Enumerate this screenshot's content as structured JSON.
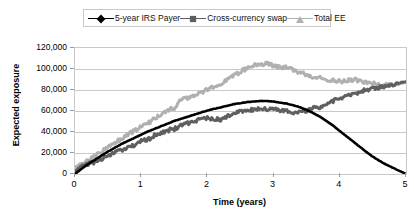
{
  "chart_data": {
    "type": "line",
    "title": "",
    "xlabel": "Time (years)",
    "ylabel": "Expected exposure",
    "xlim": [
      0,
      5
    ],
    "ylim": [
      0,
      120000
    ],
    "xticks": [
      "0",
      "1",
      "2",
      "3",
      "4",
      "5"
    ],
    "yticks": [
      "0",
      "20,000",
      "40,000",
      "60,000",
      "80,000",
      "100,000",
      "120,000"
    ],
    "grid": true,
    "legend_position": "top",
    "series": [
      {
        "name": "5-year IRS Payer",
        "color": "#000000",
        "marker": "diamond",
        "x": [
          0,
          0.1,
          0.2,
          0.3,
          0.4,
          0.5,
          0.6,
          0.7,
          0.8,
          0.9,
          1.0,
          1.1,
          1.2,
          1.3,
          1.4,
          1.5,
          1.6,
          1.7,
          1.8,
          1.9,
          2.0,
          2.1,
          2.2,
          2.3,
          2.4,
          2.5,
          2.6,
          2.7,
          2.8,
          2.9,
          3.0,
          3.1,
          3.2,
          3.3,
          3.4,
          3.5,
          3.6,
          3.7,
          3.8,
          3.9,
          4.0,
          4.1,
          4.2,
          4.3,
          4.4,
          4.5,
          4.6,
          4.7,
          4.8,
          4.9,
          5.0
        ],
        "y": [
          0,
          5000,
          9500,
          13500,
          17500,
          21500,
          25000,
          28500,
          31500,
          34500,
          37500,
          40500,
          43000,
          45500,
          48000,
          50500,
          52500,
          54500,
          56500,
          58500,
          60500,
          62000,
          63500,
          65000,
          66500,
          67500,
          68500,
          69000,
          69500,
          69500,
          69000,
          68000,
          67000,
          65500,
          63500,
          61000,
          58000,
          54500,
          50500,
          46000,
          41000,
          36000,
          31000,
          26000,
          21000,
          16500,
          12500,
          9000,
          6000,
          3000,
          0
        ]
      },
      {
        "name": "Cross-currency swap",
        "color": "#5f5f5f",
        "marker": "square",
        "x": [
          0,
          0.1,
          0.2,
          0.3,
          0.4,
          0.5,
          0.6,
          0.7,
          0.8,
          0.9,
          1.0,
          1.1,
          1.2,
          1.3,
          1.4,
          1.5,
          1.6,
          1.7,
          1.8,
          1.9,
          2.0,
          2.1,
          2.2,
          2.3,
          2.4,
          2.5,
          2.6,
          2.7,
          2.8,
          2.9,
          3.0,
          3.1,
          3.2,
          3.3,
          3.4,
          3.5,
          3.6,
          3.7,
          3.8,
          3.9,
          4.0,
          4.1,
          4.2,
          4.3,
          4.4,
          4.5,
          4.6,
          4.7,
          4.8,
          4.9,
          5.0
        ],
        "y": [
          3000,
          7500,
          9500,
          11500,
          14500,
          17000,
          20500,
          22500,
          26000,
          28000,
          31000,
          33000,
          36500,
          38500,
          41500,
          43000,
          46500,
          48000,
          50500,
          51500,
          53500,
          52000,
          52000,
          54500,
          57000,
          59500,
          60500,
          61500,
          62000,
          62000,
          61500,
          61000,
          60000,
          58500,
          59500,
          60000,
          62500,
          64000,
          67000,
          69500,
          72000,
          74500,
          76500,
          78000,
          80000,
          81500,
          82500,
          84000,
          85000,
          86500,
          88000
        ]
      },
      {
        "name": "Total EE",
        "color": "#b0b0b0",
        "marker": "triangle",
        "x": [
          0,
          0.1,
          0.2,
          0.3,
          0.4,
          0.5,
          0.6,
          0.7,
          0.8,
          0.9,
          1.0,
          1.1,
          1.2,
          1.3,
          1.4,
          1.5,
          1.6,
          1.7,
          1.8,
          1.9,
          2.0,
          2.1,
          2.2,
          2.3,
          2.4,
          2.5,
          2.6,
          2.7,
          2.8,
          2.9,
          3.0,
          3.1,
          3.2,
          3.3,
          3.4,
          3.5,
          3.6,
          3.7,
          3.8,
          3.9,
          4.0,
          4.1,
          4.2,
          4.3,
          4.4,
          4.5,
          4.6,
          4.7,
          4.8,
          4.9,
          5.0
        ],
        "y": [
          6500,
          10000,
          13000,
          16500,
          21000,
          25500,
          30000,
          33500,
          38000,
          41000,
          45000,
          48000,
          52500,
          56000,
          60500,
          63000,
          70500,
          72500,
          75000,
          77500,
          80500,
          83000,
          86500,
          90000,
          94000,
          97500,
          100500,
          103000,
          104500,
          105500,
          103000,
          102000,
          101500,
          99000,
          96500,
          94500,
          92500,
          91500,
          90000,
          89500,
          88000,
          88500,
          90000,
          88500,
          87000,
          86000,
          85500,
          84500,
          85000,
          86000,
          87500
        ]
      }
    ]
  }
}
